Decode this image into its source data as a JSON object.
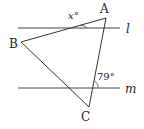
{
  "figure": {
    "type": "geometry",
    "vertices": {
      "A": {
        "label": "A",
        "x": 106,
        "y": 18
      },
      "B": {
        "label": "B",
        "x": 21,
        "y": 42
      },
      "C": {
        "label": "C",
        "x": 89,
        "y": 107
      }
    },
    "lines": {
      "l": {
        "label": "l",
        "y": 28,
        "x1": 18,
        "x2": 120
      },
      "m": {
        "label": "m",
        "y": 88,
        "x1": 18,
        "x2": 120
      }
    },
    "angles": {
      "x": {
        "label": "x°"
      },
      "given": {
        "label": "79°"
      }
    }
  }
}
